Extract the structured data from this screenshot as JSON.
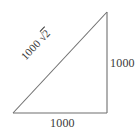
{
  "figure": {
    "type": "right-triangle-diagram",
    "background_color": "#ffffff",
    "stroke_color": "#6f6f6f",
    "text_color": "#3a3a3a",
    "labels": {
      "vertical_leg": "1000",
      "horizontal_leg": "1000",
      "hypotenuse_coefficient": "1000",
      "hypotenuse_radical_sign": "√",
      "hypotenuse_radicand": "2"
    },
    "geometry": {
      "bottom_left_vertex": "13,113",
      "bottom_right_vertex": "107,113",
      "top_right_vertex": "107,12"
    }
  }
}
